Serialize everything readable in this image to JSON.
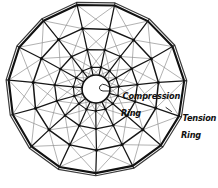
{
  "figure": {
    "type": "structural-diagram",
    "background_color": "#ffffff",
    "ink_color": "#111111",
    "secondary_ink_color": "#8a8a8a"
  },
  "labels": {
    "compression": {
      "line1": "Compression",
      "line2": "Ring"
    },
    "tension": {
      "line1": "Tension",
      "line2": "Ring"
    }
  },
  "geometry": {
    "center": {
      "x": 96,
      "y": 89
    },
    "outer_ring": {
      "sides": 15,
      "radius_x": 88,
      "radius_y": 85,
      "rotation_deg": 12,
      "double_line": true,
      "stroke_width": 2.0
    },
    "intermediate_rings": [
      {
        "name": "ring-3",
        "radius_scale": 0.72,
        "stroke_width": 1.5
      },
      {
        "name": "ring-2",
        "radius_scale": 0.47,
        "stroke_width": 1.3
      },
      {
        "name": "ring-1",
        "radius_scale": 0.26,
        "stroke_width": 1.1
      }
    ],
    "compression_ring": {
      "radius": 14,
      "stroke_width": 1.6
    },
    "radial_spokes": 15,
    "diagonal_bracing": true
  }
}
